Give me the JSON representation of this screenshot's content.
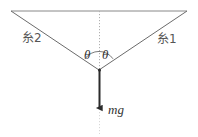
{
  "figure": {
    "type": "free-body-diagram",
    "background_color": "#ffffff",
    "line_color": "#6b6b6b",
    "arrow_color": "#2b2b2b",
    "dotted_color": "#b8b8b8",
    "labels": {
      "string_left": "糸2",
      "string_right": "糸1",
      "angle_left": "θ",
      "angle_right": "θ",
      "force": "mg"
    },
    "geometry": {
      "ceiling_left_x": 11,
      "ceiling_right_x": 187,
      "ceiling_y": 11,
      "vertex_x": 99,
      "vertex_y": 70,
      "arrow_tip_y": 112,
      "arc_radius": 17,
      "dotted_top_y": 11,
      "dotted_bottom_y": 134
    }
  }
}
